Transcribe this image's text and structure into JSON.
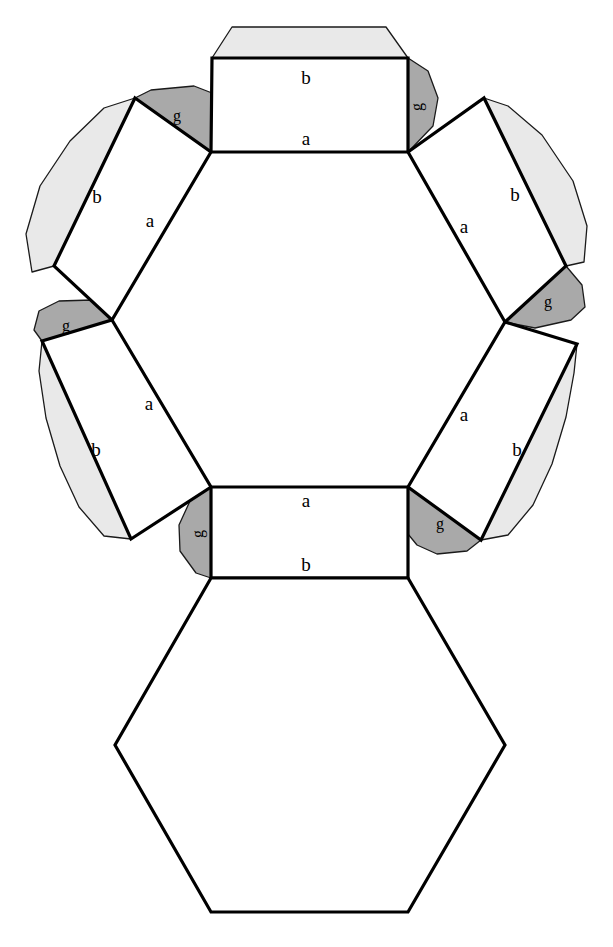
{
  "diagram": {
    "type": "polyhedron-net",
    "background_color": "#FFFFFF",
    "stroke_color": "#000000",
    "face_fill_color": "#FFFFFF",
    "glue_tab_color": "#A9A9A9",
    "fold_flap_color": "#E9E9E9",
    "thin_stroke_color": "#1A1A1A",
    "stroke_width_main": 3.2,
    "stroke_width_thin": 1.3,
    "labels": {
      "edge_a": "a",
      "edge_b": "b",
      "glue_tab": "g"
    },
    "faces": [
      {
        "id": "face-top",
        "name": "top-rectangle",
        "points": "212,58 408,58 408,152 211,152",
        "label_a": "a",
        "label_b": "b",
        "label_a_pos": [
          306,
          140
        ],
        "label_b_pos": [
          306,
          80
        ]
      },
      {
        "id": "face-upper-left",
        "name": "upper-left-rectangle",
        "points": "135,98 211,152 112,320 54,266",
        "label_a": "a",
        "label_b": "b",
        "label_a_pos": [
          149,
          222
        ],
        "label_b_pos": [
          97,
          198
        ]
      },
      {
        "id": "face-upper-right",
        "name": "upper-right-rectangle",
        "points": "408,152 484,98 566,266 505,322",
        "label_a": "a",
        "label_b": "b",
        "label_a_pos": [
          465,
          228
        ],
        "label_b_pos": [
          514,
          196
        ]
      },
      {
        "id": "face-lower-left",
        "name": "lower-left-rectangle",
        "points": "112,320 211,487 131,539 42,341",
        "label_a": "a",
        "label_b": "b",
        "label_a_pos": [
          148,
          405
        ],
        "label_b_pos": [
          96,
          450
        ]
      },
      {
        "id": "face-lower-right",
        "name": "lower-right-rectangle",
        "points": "505,322 577,344 481,540 408,487",
        "label_a": "a",
        "label_b": "b",
        "label_a_pos": [
          464,
          415
        ],
        "label_b_pos": [
          516,
          450
        ]
      },
      {
        "id": "face-bottom",
        "name": "bottom-rectangle",
        "points": "211,487 408,487 408,578 211,578",
        "label_a": "a",
        "label_b": "b",
        "label_a_pos": [
          306,
          502
        ],
        "label_b_pos": [
          306,
          566
        ]
      },
      {
        "id": "face-hexagon",
        "name": "bottom-hexagon",
        "points": "211,578 408,578 505,745 408,912 211,912 115,745",
        "label_a": "",
        "label_b": ""
      }
    ],
    "glue_tabs": [
      {
        "id": "tab-top-left",
        "name": "glue-tab-top-left",
        "points": "135,98 211,152 212,152 212,93 194,86 151,90",
        "label": "g",
        "label_pos": [
          177,
          116
        ]
      },
      {
        "id": "tab-top-right",
        "name": "glue-tab-top-right",
        "points": "408,58 428,71 438,98 433,126 408,152",
        "label": "g",
        "label_pos": [
          417,
          106
        ]
      },
      {
        "id": "tab-upper-right",
        "name": "glue-tab-upper-right",
        "points": "505,322 566,266 582,285 585,307 571,320 535,328",
        "label": "g",
        "label_pos": [
          546,
          302
        ]
      },
      {
        "id": "tab-mid-left",
        "name": "glue-tab-mid-left",
        "points": "112,320 42,341 34,330 39,311 59,301 92,300",
        "label": "g",
        "label_pos": [
          66,
          326
        ]
      },
      {
        "id": "tab-bottom-left",
        "name": "glue-tab-bottom-left",
        "points": "211,487 211,578 196,573 180,551 179,525 190,501",
        "label": "g",
        "label_pos": [
          199,
          533
        ]
      },
      {
        "id": "tab-bottom-right",
        "name": "glue-tab-bottom-right",
        "points": "408,487 481,540 467,551 437,554 417,545 408,534",
        "label": "g",
        "label_pos": [
          440,
          524
        ]
      }
    ],
    "fold_flaps": [
      {
        "id": "flap-top",
        "name": "fold-flap-top",
        "points": "212,58 408,58 386,27 232,27"
      },
      {
        "id": "flap-upper-left",
        "name": "fold-flap-upper-left",
        "points": "135,98 54,266 32,272 26,234 40,186 70,141 104,108"
      },
      {
        "id": "flap-upper-right",
        "name": "fold-flap-upper-right",
        "points": "484,98 566,266 584,262 587,226 573,181 542,135 508,106"
      },
      {
        "id": "flap-lower-left",
        "name": "fold-flap-lower-left",
        "points": "42,341 131,539 104,536 79,507 60,466 46,418 39,371"
      },
      {
        "id": "flap-lower-right",
        "name": "fold-flap-lower-right",
        "points": "577,344 481,540 508,535 533,505 552,464 566,417 574,373"
      }
    ]
  }
}
